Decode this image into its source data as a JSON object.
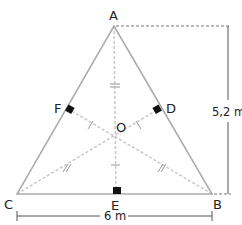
{
  "diagram": {
    "type": "equilateral-triangle-geometry",
    "vertices": {
      "A": "A",
      "B": "B",
      "C": "C"
    },
    "midpoints": {
      "D": "D",
      "E": "E",
      "F": "F"
    },
    "center": "O",
    "dimensions": {
      "height": "5,2 m",
      "base": "6 m"
    },
    "colors": {
      "side": "#aaaaaa",
      "median": "#c8c8c8",
      "dimension": "#555555",
      "right_angle_marker": "#111111",
      "text": "#222222"
    }
  }
}
